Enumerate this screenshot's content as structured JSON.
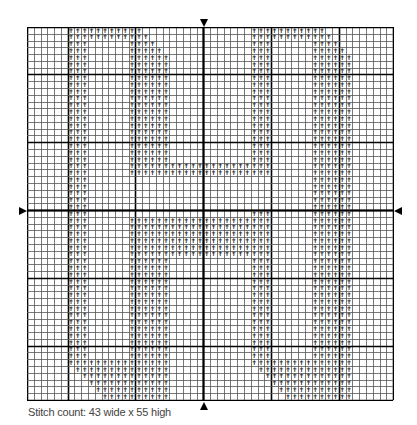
{
  "chart": {
    "columns": 54,
    "rows": 55,
    "cell_size": 6.78,
    "major_every": 10,
    "major_col_offset": 6,
    "major_row_offset": 7,
    "center_col": 26,
    "center_row": 27,
    "symbol": "✝",
    "colors": {
      "grid_minor": "#555555",
      "grid_major": "#000000",
      "symbol": "#111111",
      "background": "#ffffff"
    },
    "stitch_runs": [
      {
        "row": 0,
        "runs": [
          [
            6,
            16
          ],
          [
            33,
            43
          ]
        ]
      },
      {
        "row": 1,
        "runs": [
          [
            6,
            17
          ],
          [
            33,
            44
          ]
        ]
      },
      {
        "row": 2,
        "runs": [
          [
            6,
            8
          ],
          [
            15,
            18
          ],
          [
            33,
            35
          ],
          [
            42,
            45
          ]
        ]
      },
      {
        "row": 3,
        "runs": [
          [
            6,
            8
          ],
          [
            15,
            19
          ],
          [
            33,
            35
          ],
          [
            42,
            46
          ]
        ]
      },
      {
        "row": 4,
        "runs": [
          [
            6,
            8
          ],
          [
            15,
            20
          ],
          [
            33,
            35
          ],
          [
            42,
            47
          ]
        ]
      },
      {
        "row": 5,
        "runs": [
          [
            6,
            8
          ],
          [
            15,
            20
          ],
          [
            33,
            35
          ],
          [
            42,
            47
          ]
        ]
      },
      {
        "row": 6,
        "runs": [
          [
            6,
            8
          ],
          [
            15,
            20
          ],
          [
            33,
            35
          ],
          [
            42,
            47
          ]
        ]
      },
      {
        "row": 7,
        "runs": [
          [
            6,
            8
          ],
          [
            15,
            20
          ],
          [
            33,
            35
          ],
          [
            42,
            47
          ]
        ]
      },
      {
        "row": 8,
        "runs": [
          [
            6,
            8
          ],
          [
            15,
            20
          ],
          [
            33,
            35
          ],
          [
            42,
            47
          ]
        ]
      },
      {
        "row": 9,
        "runs": [
          [
            6,
            8
          ],
          [
            15,
            20
          ],
          [
            33,
            35
          ],
          [
            42,
            47
          ]
        ]
      },
      {
        "row": 10,
        "runs": [
          [
            6,
            8
          ],
          [
            15,
            20
          ],
          [
            33,
            35
          ],
          [
            42,
            47
          ]
        ]
      },
      {
        "row": 11,
        "runs": [
          [
            6,
            8
          ],
          [
            15,
            20
          ],
          [
            33,
            35
          ],
          [
            42,
            47
          ]
        ]
      },
      {
        "row": 12,
        "runs": [
          [
            6,
            8
          ],
          [
            15,
            20
          ],
          [
            33,
            35
          ],
          [
            42,
            47
          ]
        ]
      },
      {
        "row": 13,
        "runs": [
          [
            6,
            8
          ],
          [
            15,
            20
          ],
          [
            33,
            35
          ],
          [
            42,
            47
          ]
        ]
      },
      {
        "row": 14,
        "runs": [
          [
            6,
            8
          ],
          [
            15,
            20
          ],
          [
            33,
            35
          ],
          [
            42,
            47
          ]
        ]
      },
      {
        "row": 15,
        "runs": [
          [
            6,
            8
          ],
          [
            15,
            20
          ],
          [
            33,
            35
          ],
          [
            42,
            47
          ]
        ]
      },
      {
        "row": 16,
        "runs": [
          [
            6,
            8
          ],
          [
            15,
            20
          ],
          [
            33,
            35
          ],
          [
            42,
            47
          ]
        ]
      },
      {
        "row": 17,
        "runs": [
          [
            6,
            8
          ],
          [
            15,
            20
          ],
          [
            33,
            35
          ],
          [
            42,
            47
          ]
        ]
      },
      {
        "row": 18,
        "runs": [
          [
            6,
            8
          ],
          [
            15,
            20
          ],
          [
            33,
            35
          ],
          [
            42,
            47
          ]
        ]
      },
      {
        "row": 19,
        "runs": [
          [
            6,
            8
          ],
          [
            15,
            20
          ],
          [
            33,
            35
          ],
          [
            42,
            47
          ]
        ]
      },
      {
        "row": 20,
        "runs": [
          [
            6,
            8
          ],
          [
            15,
            35
          ],
          [
            42,
            47
          ]
        ]
      },
      {
        "row": 21,
        "runs": [
          [
            6,
            8
          ],
          [
            15,
            35
          ],
          [
            42,
            47
          ]
        ]
      },
      {
        "row": 22,
        "runs": [
          [
            6,
            8
          ],
          [
            42,
            47
          ]
        ]
      },
      {
        "row": 23,
        "runs": [
          [
            6,
            8
          ],
          [
            42,
            47
          ]
        ]
      },
      {
        "row": 24,
        "runs": [
          [
            6,
            8
          ],
          [
            42,
            47
          ]
        ]
      },
      {
        "row": 25,
        "runs": [
          [
            6,
            8
          ],
          [
            42,
            47
          ]
        ]
      },
      {
        "row": 26,
        "runs": [
          [
            6,
            8
          ],
          [
            42,
            47
          ]
        ]
      },
      {
        "row": 27,
        "runs": [
          [
            6,
            8
          ],
          [
            33,
            35
          ],
          [
            42,
            47
          ]
        ]
      },
      {
        "row": 28,
        "runs": [
          [
            6,
            8
          ],
          [
            15,
            35
          ],
          [
            42,
            47
          ]
        ]
      },
      {
        "row": 29,
        "runs": [
          [
            6,
            8
          ],
          [
            15,
            35
          ],
          [
            42,
            47
          ]
        ]
      },
      {
        "row": 30,
        "runs": [
          [
            6,
            8
          ],
          [
            15,
            35
          ],
          [
            42,
            47
          ]
        ]
      },
      {
        "row": 31,
        "runs": [
          [
            6,
            8
          ],
          [
            15,
            35
          ],
          [
            42,
            47
          ]
        ]
      },
      {
        "row": 32,
        "runs": [
          [
            6,
            8
          ],
          [
            15,
            35
          ],
          [
            42,
            47
          ]
        ]
      },
      {
        "row": 33,
        "runs": [
          [
            6,
            8
          ],
          [
            15,
            35
          ],
          [
            42,
            47
          ]
        ]
      },
      {
        "row": 34,
        "runs": [
          [
            6,
            8
          ],
          [
            15,
            20
          ],
          [
            33,
            35
          ],
          [
            42,
            47
          ]
        ]
      },
      {
        "row": 35,
        "runs": [
          [
            6,
            8
          ],
          [
            15,
            20
          ],
          [
            33,
            35
          ],
          [
            42,
            47
          ]
        ]
      },
      {
        "row": 36,
        "runs": [
          [
            6,
            8
          ],
          [
            15,
            20
          ],
          [
            33,
            35
          ],
          [
            42,
            47
          ]
        ]
      },
      {
        "row": 37,
        "runs": [
          [
            6,
            8
          ],
          [
            15,
            20
          ],
          [
            33,
            35
          ],
          [
            42,
            47
          ]
        ]
      },
      {
        "row": 38,
        "runs": [
          [
            6,
            8
          ],
          [
            15,
            20
          ],
          [
            33,
            35
          ],
          [
            42,
            47
          ]
        ]
      },
      {
        "row": 39,
        "runs": [
          [
            6,
            8
          ],
          [
            15,
            20
          ],
          [
            33,
            35
          ],
          [
            42,
            47
          ]
        ]
      },
      {
        "row": 40,
        "runs": [
          [
            6,
            8
          ],
          [
            15,
            20
          ],
          [
            33,
            35
          ],
          [
            42,
            47
          ]
        ]
      },
      {
        "row": 41,
        "runs": [
          [
            6,
            8
          ],
          [
            15,
            20
          ],
          [
            33,
            35
          ],
          [
            42,
            47
          ]
        ]
      },
      {
        "row": 42,
        "runs": [
          [
            6,
            8
          ],
          [
            15,
            20
          ],
          [
            33,
            35
          ],
          [
            42,
            47
          ]
        ]
      },
      {
        "row": 43,
        "runs": [
          [
            6,
            8
          ],
          [
            15,
            20
          ],
          [
            33,
            35
          ],
          [
            42,
            47
          ]
        ]
      },
      {
        "row": 44,
        "runs": [
          [
            6,
            8
          ],
          [
            15,
            20
          ],
          [
            33,
            35
          ],
          [
            42,
            47
          ]
        ]
      },
      {
        "row": 45,
        "runs": [
          [
            6,
            8
          ],
          [
            15,
            20
          ],
          [
            33,
            35
          ],
          [
            42,
            47
          ]
        ]
      },
      {
        "row": 46,
        "runs": [
          [
            6,
            8
          ],
          [
            15,
            20
          ],
          [
            33,
            35
          ],
          [
            42,
            47
          ]
        ]
      },
      {
        "row": 47,
        "runs": [
          [
            6,
            8
          ],
          [
            15,
            20
          ],
          [
            33,
            35
          ],
          [
            42,
            47
          ]
        ]
      },
      {
        "row": 48,
        "runs": [
          [
            6,
            8
          ],
          [
            15,
            20
          ],
          [
            33,
            35
          ],
          [
            42,
            47
          ]
        ]
      },
      {
        "row": 49,
        "runs": [
          [
            6,
            20
          ],
          [
            33,
            47
          ]
        ]
      },
      {
        "row": 50,
        "runs": [
          [
            7,
            20
          ],
          [
            34,
            47
          ]
        ]
      },
      {
        "row": 51,
        "runs": [
          [
            8,
            20
          ],
          [
            35,
            47
          ]
        ]
      },
      {
        "row": 52,
        "runs": [
          [
            9,
            20
          ],
          [
            36,
            47
          ]
        ]
      },
      {
        "row": 53,
        "runs": [
          [
            10,
            20
          ],
          [
            37,
            47
          ]
        ]
      },
      {
        "row": 54,
        "runs": [
          [
            11,
            20
          ],
          [
            38,
            47
          ]
        ]
      }
    ]
  },
  "markers": {
    "top": "center-column-marker",
    "bottom": "center-column-marker",
    "left": "center-row-marker",
    "right": "center-row-marker"
  },
  "caption": "Stitch count: 43 wide x 55 high"
}
